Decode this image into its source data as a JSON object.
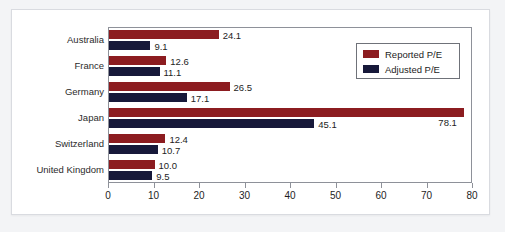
{
  "chart_data": {
    "type": "bar",
    "orientation": "horizontal",
    "title": "",
    "subtitle": "",
    "xlabel": "",
    "ylabel": "",
    "xlim": [
      0,
      80
    ],
    "xticks": [
      0,
      10,
      20,
      30,
      40,
      50,
      60,
      70,
      80
    ],
    "xtick_labels": [
      "0",
      "10",
      "20",
      "30",
      "40",
      "50",
      "60",
      "70",
      "80"
    ],
    "grid": false,
    "legend_position": "top-right",
    "categories": [
      "Australia",
      "France",
      "Germany",
      "Japan",
      "Switzerland",
      "United Kingdom"
    ],
    "series": [
      {
        "name": "Reported P/E",
        "color": "#8c1c20",
        "values": [
          24.1,
          12.6,
          26.5,
          78.1,
          12.4,
          10.0
        ],
        "labels": [
          "24.1",
          "12.6",
          "26.5",
          "78.1",
          "12.4",
          "10.0"
        ]
      },
      {
        "name": "Adjusted P/E",
        "color": "#17193a",
        "values": [
          9.1,
          11.1,
          17.1,
          45.1,
          10.7,
          9.5
        ],
        "labels": [
          "9.1",
          "11.1",
          "17.1",
          "45.1",
          "10.7",
          "9.5"
        ]
      }
    ]
  },
  "legend": {
    "items": [
      {
        "label": "Reported P/E",
        "color": "#8c1c20"
      },
      {
        "label": "Adjusted P/E",
        "color": "#17193a"
      }
    ]
  },
  "colors": {
    "reported": "#8c1c20",
    "adjusted": "#17193a",
    "axis": "#8e9199",
    "frame": "#d9dbe0",
    "background": "#ffffff",
    "outer_background": "#f3f4f6",
    "text": "#1d1d1d"
  }
}
